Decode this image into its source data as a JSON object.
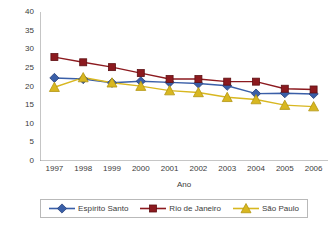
{
  "chart_data": {
    "type": "line",
    "title": "",
    "xlabel": "Ano",
    "ylabel": "",
    "categories": [
      "1997",
      "1998",
      "1999",
      "2000",
      "2001",
      "2002",
      "2003",
      "2004",
      "2005",
      "2006"
    ],
    "x": [
      1997,
      1998,
      1999,
      2000,
      2001,
      2002,
      2003,
      2004,
      2005,
      2006
    ],
    "xlim": [
      1996.5,
      2006.5
    ],
    "ylim": [
      0,
      40
    ],
    "yticks": [
      0,
      5,
      10,
      15,
      20,
      25,
      30,
      35,
      40
    ],
    "grid": false,
    "legend_position": "bottom",
    "series": [
      {
        "name": "Espírito Santo",
        "color": "#3a5fa8",
        "marker": "diamond",
        "values": [
          22.3,
          22.0,
          21.0,
          21.4,
          21.1,
          20.8,
          20.2,
          18.1,
          18.2,
          18.0
        ]
      },
      {
        "name": "Rio de Janeiro",
        "color": "#8c1a1f",
        "marker": "square",
        "values": [
          27.9,
          26.5,
          25.2,
          23.6,
          22.0,
          22.0,
          21.3,
          21.3,
          19.4,
          19.2
        ]
      },
      {
        "name": "São Paulo",
        "color": "#d8b720",
        "marker": "triangle",
        "values": [
          19.8,
          22.4,
          21.0,
          20.1,
          18.9,
          18.4,
          17.1,
          16.5,
          15.0,
          14.6
        ]
      }
    ]
  },
  "axis": {
    "line_color": "#8c8c8c",
    "tick_color": "#8c8c8c",
    "label_color": "#3b3b3b"
  },
  "legend": {
    "border_color": "#b9b9b9",
    "entries": [
      {
        "label": "Espírito Santo"
      },
      {
        "label": "Rio de Janeiro"
      },
      {
        "label": "São Paulo"
      }
    ]
  }
}
